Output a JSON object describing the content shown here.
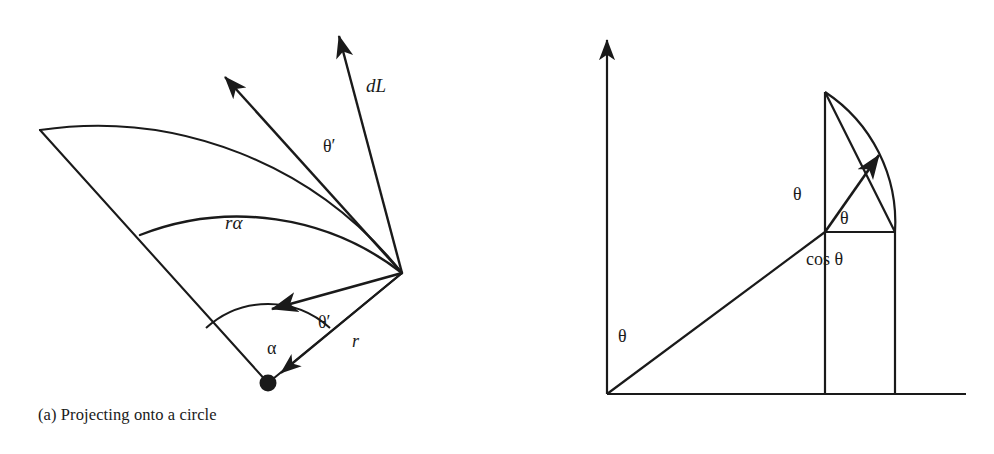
{
  "figure": {
    "background": "#ffffff",
    "stroke_color": "#1a1a1a",
    "width": 994,
    "height": 454
  },
  "panel_a": {
    "caption": "(a) Projecting onto a circle",
    "labels": {
      "dl": "dL",
      "theta_prime_upper": "θ′",
      "r_alpha": "rα",
      "theta_prime_lower": "θ′",
      "alpha": "α",
      "r": "r"
    },
    "geometry": {
      "apex": [
        402,
        273
      ],
      "outer_arc_start": [
        40,
        130
      ],
      "inner_arc_start": [
        140,
        235
      ],
      "point_dot": [
        268,
        383
      ],
      "dot_radius": 8,
      "outer_radius": 390,
      "inner_radius": 268,
      "arrow_dl_tip": [
        336,
        30
      ],
      "arrow_diagonal_tip": [
        220,
        72
      ],
      "arrow_horizontal_tip": [
        265,
        310
      ]
    }
  },
  "panel_b": {
    "caption": "(b) Projecting onto a line",
    "labels": {
      "theta_axis": "θ",
      "theta_vertical": "θ",
      "theta_inner": "θ",
      "cos_theta": "cos θ"
    },
    "geometry": {
      "origin": [
        607,
        394
      ],
      "y_axis_tip": [
        607,
        33
      ],
      "x_axis_end": [
        966,
        394
      ],
      "circle_center": [
        825,
        232
      ],
      "circle_radius": 140,
      "arc_top": [
        825,
        92
      ],
      "arc_right": [
        895,
        232
      ],
      "arrow_tip": [
        884,
        152
      ]
    }
  }
}
